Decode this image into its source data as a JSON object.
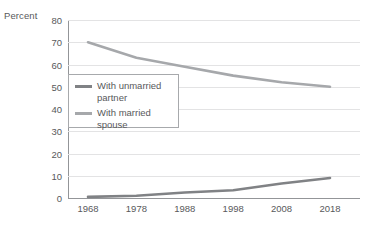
{
  "chart_data": {
    "type": "line",
    "title": "",
    "xlabel": "",
    "ylabel": "Percent",
    "x": [
      1968,
      1978,
      1988,
      1998,
      2008,
      2018
    ],
    "categories": [
      "1968",
      "1978",
      "1988",
      "1998",
      "2008",
      "2018"
    ],
    "ylim": [
      0,
      80
    ],
    "xlim": [
      1968,
      2018
    ],
    "yticks": [
      0,
      10,
      20,
      30,
      40,
      50,
      60,
      70,
      80
    ],
    "ytick_labels": [
      "0",
      "10",
      "20",
      "30",
      "40",
      "50",
      "60",
      "70",
      "80"
    ],
    "grid": true,
    "grid_axis": "y",
    "legend_position": "inside-upper-left",
    "series": [
      {
        "name": "With married spouse",
        "color": "#a6a8ab",
        "values": [
          70,
          63,
          59,
          55,
          52,
          50
        ]
      },
      {
        "name": "With unmarried partner",
        "color": "#808285",
        "values": [
          0.5,
          1,
          2.5,
          3.5,
          6.5,
          9
        ]
      }
    ]
  },
  "legend": {
    "items": [
      {
        "label": "With unmarried\npartner",
        "color": "#808285"
      },
      {
        "label": "With married\nspouse",
        "color": "#a6a8ab"
      }
    ]
  },
  "colors": {
    "axis": "#939598",
    "grid": "#e3e3e4",
    "text": "#58595b",
    "legend_border": "#a7a9ac",
    "series_unmarried": "#808285",
    "series_married": "#a6a8ab"
  }
}
